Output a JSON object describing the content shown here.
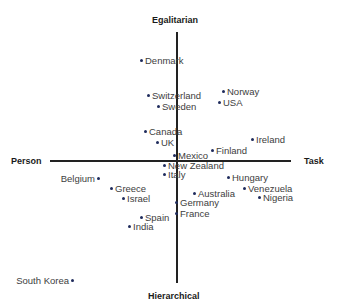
{
  "axes": {
    "top": "Egalitarian",
    "bottom": "Hierarchical",
    "left": "Person",
    "right": "Task"
  },
  "colors": {
    "dot": "#1f2b5c",
    "label": "#3d3d3d",
    "axis": "#222222"
  },
  "countries": [
    {
      "name": "Denmark",
      "x": 140,
      "y": 61,
      "dot": "left"
    },
    {
      "name": "Switzerland",
      "x": 147,
      "y": 96,
      "dot": "left"
    },
    {
      "name": "Sweden",
      "x": 157,
      "y": 107,
      "dot": "left"
    },
    {
      "name": "Norway",
      "x": 222,
      "y": 92,
      "dot": "left"
    },
    {
      "name": "USA",
      "x": 218,
      "y": 103,
      "dot": "left"
    },
    {
      "name": "Canada",
      "x": 144,
      "y": 132,
      "dot": "left"
    },
    {
      "name": "UK",
      "x": 156,
      "y": 143,
      "dot": "left"
    },
    {
      "name": "Ireland",
      "x": 251,
      "y": 140,
      "dot": "left"
    },
    {
      "name": "Mexico",
      "x": 173,
      "y": 156,
      "dot": "left"
    },
    {
      "name": "Finland",
      "x": 211,
      "y": 151,
      "dot": "left"
    },
    {
      "name": "New Zealand",
      "x": 163,
      "y": 166,
      "dot": "left"
    },
    {
      "name": "Italy",
      "x": 163,
      "y": 175,
      "dot": "left"
    },
    {
      "name": "Belgium",
      "x": 95,
      "y": 179,
      "dot": "right"
    },
    {
      "name": "Hungary",
      "x": 227,
      "y": 178,
      "dot": "left"
    },
    {
      "name": "Greece",
      "x": 110,
      "y": 189,
      "dot": "left"
    },
    {
      "name": "Venezuela",
      "x": 243,
      "y": 189,
      "dot": "left"
    },
    {
      "name": "Australia",
      "x": 193,
      "y": 194,
      "dot": "left"
    },
    {
      "name": "Israel",
      "x": 122,
      "y": 199,
      "dot": "left"
    },
    {
      "name": "Nigeria",
      "x": 258,
      "y": 198,
      "dot": "left"
    },
    {
      "name": "Germany",
      "x": 175,
      "y": 203,
      "dot": "left"
    },
    {
      "name": "France",
      "x": 175,
      "y": 214,
      "dot": "left"
    },
    {
      "name": "Spain",
      "x": 140,
      "y": 218,
      "dot": "left"
    },
    {
      "name": "India",
      "x": 128,
      "y": 227,
      "dot": "left"
    },
    {
      "name": "South Korea",
      "x": 69,
      "y": 281,
      "dot": "right"
    }
  ]
}
